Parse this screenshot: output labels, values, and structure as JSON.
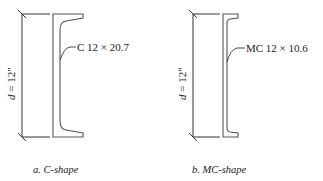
{
  "panels": [
    {
      "id": "a",
      "shape_label": "C 12 × 20.7",
      "dimension_label_var": "d",
      "dimension_label_value": " = 12\"",
      "caption": "a. C-shape"
    },
    {
      "id": "b",
      "shape_label": "MC 12 × 10.6",
      "dimension_label_var": "d",
      "dimension_label_value": " = 12\"",
      "caption": "b. MC-shape"
    }
  ],
  "colors": {
    "line": "#555555",
    "dimension": "#333333",
    "text": "#222222"
  }
}
